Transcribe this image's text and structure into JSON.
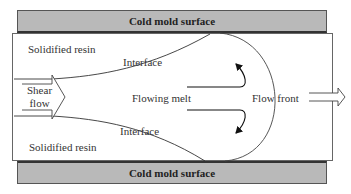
{
  "diagram": {
    "top_mold_label": "Cold mold surface",
    "bottom_mold_label": "Cold mold surface",
    "solidified_top": "Solidified resin",
    "solidified_bottom": "Solidified resin",
    "interface_top": "Interface",
    "interface_bottom": "Interface",
    "shear_flow_line1": "Shear",
    "shear_flow_line2": "flow",
    "flowing_melt": "Flowing melt",
    "flow_front": "Flow front",
    "colors": {
      "mold_fill": "#b9b9b9",
      "line": "#333333",
      "background": "#ffffff"
    }
  }
}
